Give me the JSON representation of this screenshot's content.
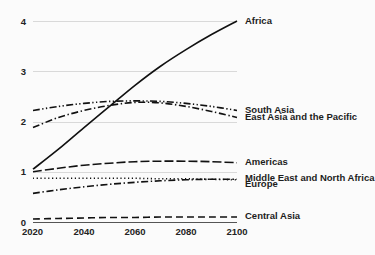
{
  "chart_data": {
    "type": "line",
    "title": "",
    "subtitle": "",
    "xlabel": "",
    "ylabel": "",
    "xlim": [
      2020,
      2100
    ],
    "ylim": [
      0,
      4.25
    ],
    "grid": true,
    "legend_position": "right-inline",
    "x_ticks": [
      "2020",
      "2040",
      "2060",
      "2080",
      "2100"
    ],
    "x_tick_values": [
      2020,
      2040,
      2060,
      2080,
      2100
    ],
    "y_ticks": [
      "0",
      "1",
      "2",
      "3",
      "4"
    ],
    "y_tick_values": [
      0,
      1,
      2,
      3,
      4
    ],
    "x": [
      2020,
      2030,
      2040,
      2050,
      2060,
      2070,
      2080,
      2090,
      2100
    ],
    "series": [
      {
        "name": "Africa",
        "style": "solid",
        "values": [
          1.05,
          1.45,
          1.88,
          2.3,
          2.72,
          3.1,
          3.43,
          3.73,
          4.0
        ]
      },
      {
        "name": "South Asia",
        "style": "dash-dot-dot",
        "values": [
          2.22,
          2.3,
          2.36,
          2.4,
          2.41,
          2.4,
          2.36,
          2.3,
          2.22
        ]
      },
      {
        "name": "East Asia and the Pacific",
        "style": "dash-dot",
        "values": [
          1.88,
          2.08,
          2.22,
          2.32,
          2.38,
          2.37,
          2.3,
          2.2,
          2.08
        ]
      },
      {
        "name": "Americas",
        "style": "long-dash",
        "values": [
          1.0,
          1.07,
          1.13,
          1.17,
          1.2,
          1.21,
          1.21,
          1.2,
          1.18
        ]
      },
      {
        "name": "Middle East and North Africa",
        "style": "dotted",
        "values": [
          0.87,
          0.87,
          0.87,
          0.87,
          0.87,
          0.86,
          0.86,
          0.85,
          0.84
        ]
      },
      {
        "name": "Europe",
        "style": "dash-dot",
        "values": [
          0.57,
          0.64,
          0.7,
          0.75,
          0.79,
          0.82,
          0.84,
          0.85,
          0.85
        ]
      },
      {
        "name": "Central Asia",
        "style": "dashed",
        "values": [
          0.06,
          0.07,
          0.08,
          0.09,
          0.09,
          0.1,
          0.1,
          0.1,
          0.1
        ]
      }
    ],
    "legend_entries": [
      {
        "label": "Africa",
        "y_value": 4.0
      },
      {
        "label": "South Asia",
        "y_value": 2.22
      },
      {
        "label": "East Asia and the Pacific",
        "y_value": 2.08
      },
      {
        "label": "Americas",
        "y_value": 1.18
      },
      {
        "label": "Middle East and North Africa",
        "y_value": 0.87
      },
      {
        "label": "Europe",
        "y_value": 0.74
      },
      {
        "label": "Central Asia",
        "y_value": 0.1
      }
    ]
  },
  "colors": {
    "background": "#fbfbfb",
    "line": "#111111",
    "grid": "#d9d9d9",
    "axis": "#555555",
    "text": "#1d1d1d"
  }
}
